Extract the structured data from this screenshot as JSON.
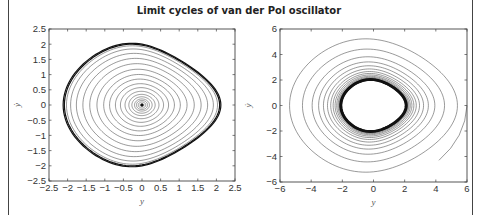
{
  "chart_data": [
    {
      "type": "line",
      "title": "Limit cycles of van der Pol oscillator",
      "subplot": "left",
      "xlabel": "y",
      "ylabel": "ẏ",
      "xlim": [
        -2.5,
        2.5
      ],
      "ylim": [
        -2.5,
        2.5
      ],
      "xticks": [
        "-2.5",
        "-2",
        "-1.5",
        "-1",
        "-0.5",
        "0",
        "0.5",
        "1",
        "1.5",
        "2",
        "2.5"
      ],
      "yticks": [
        "-2.5",
        "-2",
        "-1.5",
        "-1",
        "-0.5",
        "0",
        "0.5",
        "1",
        "1.5",
        "2",
        "2.5"
      ],
      "description": "Phase-plane trajectory spiraling outward from origin (0,0) to the limit cycle of amplitude ~2",
      "limit_cycle": {
        "x_range": [
          -2.0,
          2.0
        ],
        "y_range": [
          -2.0,
          2.0
        ]
      },
      "spiral_radii": [
        0.05,
        0.1,
        0.15,
        0.2,
        0.27,
        0.35,
        0.45,
        0.57,
        0.7,
        0.85,
        1.0,
        1.17,
        1.35,
        1.52,
        1.68,
        1.82,
        1.92,
        1.97,
        2.0
      ],
      "grid": false
    },
    {
      "type": "line",
      "subplot": "right",
      "xlabel": "y",
      "ylabel": "ẏ",
      "xlim": [
        -6,
        6
      ],
      "ylim": [
        -6,
        6
      ],
      "xticks": [
        "-6",
        "-4",
        "-2",
        "0",
        "2",
        "4",
        "6"
      ],
      "yticks": [
        "-6",
        "-4",
        "-2",
        "0",
        "2",
        "4",
        "6"
      ],
      "description": "Phase-plane trajectory starting near (6,0) spiraling inward to the limit cycle of amplitude ~2",
      "limit_cycle": {
        "x_range": [
          -2.0,
          2.0
        ],
        "y_range": [
          -2.0,
          2.0
        ]
      },
      "spiral_radii": [
        5.2,
        4.4,
        3.8,
        3.4,
        3.1,
        2.85,
        2.65,
        2.5,
        2.38,
        2.28,
        2.2,
        2.14,
        2.09,
        2.05,
        2.02,
        2.0
      ],
      "start_point": [
        6,
        0
      ],
      "grid": false
    }
  ],
  "title": "Limit cycles of van der Pol oscillator",
  "left": {
    "xticks": [
      "−2.5",
      "−2",
      "−1.5",
      "−1",
      "−0.5",
      "0",
      "0.5",
      "1",
      "1.5",
      "2",
      "2.5"
    ],
    "yticks": [
      "2.5",
      "2",
      "1.5",
      "1",
      "0.5",
      "0",
      "−0.5",
      "−1",
      "−1.5",
      "−2",
      "−2.5"
    ],
    "xlabel": "y",
    "ylabel": "ẏ"
  },
  "right": {
    "xticks": [
      "−6",
      "−4",
      "−2",
      "0",
      "2",
      "4",
      "6"
    ],
    "yticks": [
      "6",
      "4",
      "2",
      "0",
      "−2",
      "−4",
      "−6"
    ],
    "xlabel": "y",
    "ylabel": "ẏ"
  }
}
